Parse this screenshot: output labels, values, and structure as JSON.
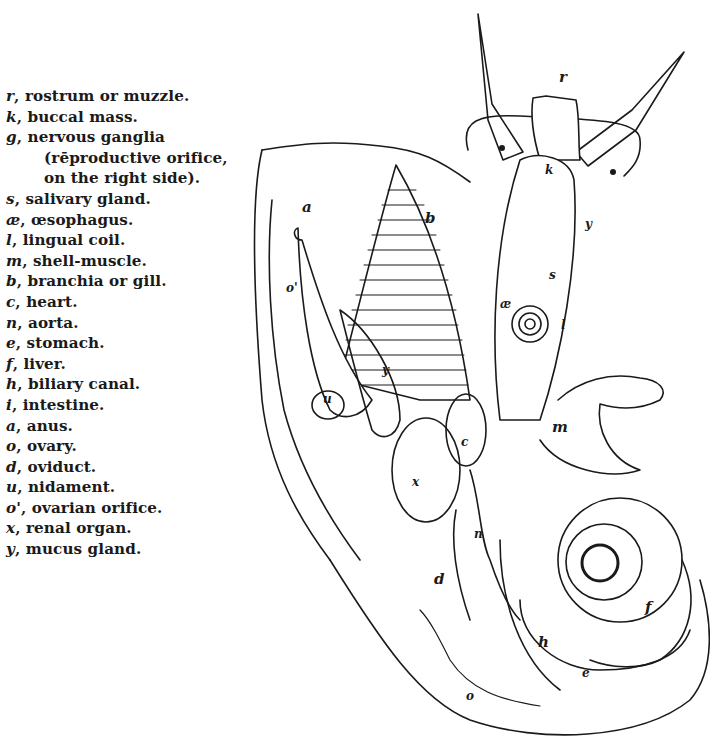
{
  "legend": {
    "items": [
      {
        "key": "r",
        "text": "rostrum or muzzle."
      },
      {
        "key": "k",
        "text": "buccal mass."
      },
      {
        "key": "g",
        "text": "nervous ganglia",
        "continuation": [
          "(rēproductive orifice,",
          "on the right side)."
        ]
      },
      {
        "key": "s",
        "text": "salivary gland."
      },
      {
        "key": "æ",
        "text": "œsophagus."
      },
      {
        "key": "l",
        "text": "lingual coil."
      },
      {
        "key": "m",
        "text": "shell-muscle."
      },
      {
        "key": "b",
        "text": "branchia or gill."
      },
      {
        "key": "c",
        "text": "heart."
      },
      {
        "key": "n",
        "text": "aorta."
      },
      {
        "key": "e",
        "text": "stomach."
      },
      {
        "key": "f",
        "text": "liver."
      },
      {
        "key": "h",
        "text": "biliary canal."
      },
      {
        "key": "i",
        "text": "intestine."
      },
      {
        "key": "a",
        "text": "anus."
      },
      {
        "key": "o",
        "text": "ovary."
      },
      {
        "key": "d",
        "text": "oviduct."
      },
      {
        "key": "u",
        "text": "nidament."
      },
      {
        "key": "o'",
        "text": "ovarian orifice."
      },
      {
        "key": "x",
        "text": "renal organ."
      },
      {
        "key": "y",
        "text": "mucus gland."
      }
    ]
  },
  "figure": {
    "labels": {
      "r": "r",
      "k": "k",
      "g": "g",
      "s": "s",
      "ae": "æ",
      "l": "l",
      "a": "a",
      "b": "b",
      "o_prime": "o'",
      "u": "u",
      "y": "y",
      "x": "x",
      "c": "c",
      "m": "m",
      "n": "n",
      "d": "d",
      "f": "f",
      "h": "h",
      "e": "e",
      "o": "o"
    }
  }
}
